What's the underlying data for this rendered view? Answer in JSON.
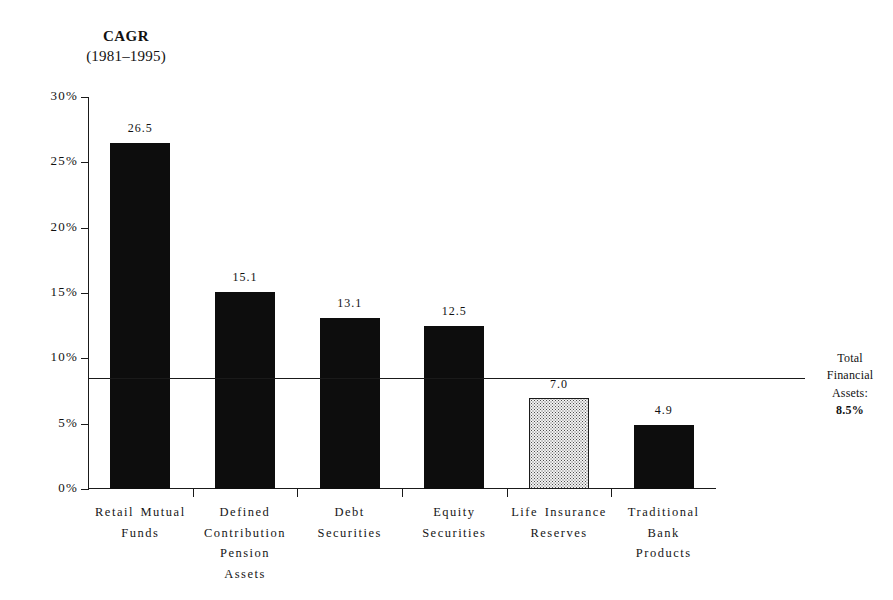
{
  "chart_data": {
    "type": "bar",
    "title": "CAGR",
    "subtitle": "(1981–1995)",
    "xlabel": "",
    "ylabel": "",
    "ylim": [
      0,
      30
    ],
    "grid": false,
    "legend": "none",
    "categories": [
      "Retail Mutual Funds",
      "Defined Contribution Pension Assets",
      "Debt Securities",
      "Equity Securities",
      "Life Insurance Reserves",
      "Traditional Bank Products"
    ],
    "category_lines": [
      [
        "Retail Mutual",
        "Funds"
      ],
      [
        "Defined",
        "Contribution",
        "Pension",
        "Assets"
      ],
      [
        "Debt",
        "Securities"
      ],
      [
        "Equity",
        "Securities"
      ],
      [
        "Life Insurance",
        "Reserves"
      ],
      [
        "Traditional",
        "Bank",
        "Products"
      ]
    ],
    "values": [
      26.5,
      15.1,
      13.1,
      12.5,
      7.0,
      4.9
    ],
    "value_labels": [
      "26.5",
      "15.1",
      "13.1",
      "12.5",
      "7.0",
      "4.9"
    ],
    "bar_styles": [
      "solid",
      "solid",
      "solid",
      "solid",
      "stippled",
      "solid"
    ],
    "y_ticks": [
      0,
      5,
      10,
      15,
      20,
      25,
      30
    ],
    "y_tick_labels": [
      "0%",
      "5%",
      "10%",
      "15%",
      "20%",
      "25%",
      "30%"
    ],
    "reference_line": {
      "value": 8.5,
      "label_lines": [
        "Total",
        "Financial",
        "Assets:"
      ],
      "label_value": "8.5%"
    },
    "colors": {
      "bar_solid": "#0d0d0d",
      "bar_stippled_fill": "#f2f2f2",
      "bar_stippled_border": "#1a1a1a",
      "axis": "#1a1a1a",
      "background": "#ffffff",
      "text": "#111111"
    }
  }
}
